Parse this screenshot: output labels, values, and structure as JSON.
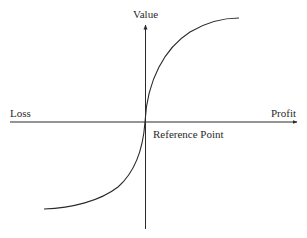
{
  "diagram": {
    "type": "value-function",
    "labels": {
      "y_axis": "Value",
      "x_axis_negative": "Loss",
      "x_axis_positive": "Profit",
      "origin": "Reference Point"
    },
    "colors": {
      "line": "#2a2a2a",
      "background": "#ffffff"
    },
    "geometry": {
      "origin": [
        145,
        122
      ],
      "x_axis": {
        "from": [
          10,
          122
        ],
        "to": [
          298,
          122
        ]
      },
      "y_axis": {
        "from": [
          145,
          229
        ],
        "to": [
          145,
          24
        ]
      },
      "curve_gain_end": [
        239,
        18
      ],
      "curve_loss_end": [
        44,
        209
      ]
    }
  }
}
